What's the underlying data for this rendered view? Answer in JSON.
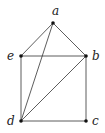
{
  "graph": {
    "colors": {
      "edge": "#333333",
      "node": "#111111",
      "label": "#222222",
      "background": "#ffffff"
    },
    "nodes": [
      {
        "id": "a",
        "label": "a",
        "x": 53,
        "y": 23,
        "lx": 52,
        "ly": 15
      },
      {
        "id": "b",
        "label": "b",
        "x": 86,
        "y": 56,
        "lx": 92,
        "ly": 60
      },
      {
        "id": "c",
        "label": "c",
        "x": 86,
        "y": 121,
        "lx": 92,
        "ly": 125
      },
      {
        "id": "d",
        "label": "d",
        "x": 21,
        "y": 121,
        "lx": 7,
        "ly": 125
      },
      {
        "id": "e",
        "label": "e",
        "x": 21,
        "y": 56,
        "lx": 7,
        "ly": 60
      }
    ],
    "edges": [
      [
        "a",
        "e"
      ],
      [
        "a",
        "b"
      ],
      [
        "a",
        "d"
      ],
      [
        "e",
        "b"
      ],
      [
        "e",
        "d"
      ],
      [
        "b",
        "d"
      ],
      [
        "b",
        "c"
      ],
      [
        "d",
        "c"
      ]
    ]
  }
}
